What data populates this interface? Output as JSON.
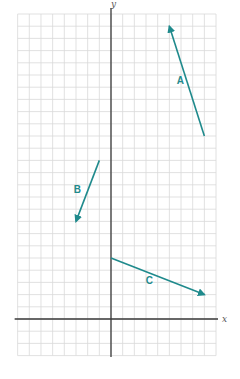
{
  "chart_data": {
    "type": "vector-diagram",
    "title": "",
    "xlabel": "x",
    "ylabel": "y",
    "xlim": [
      -8,
      9
    ],
    "ylim": [
      -3,
      25
    ],
    "grid": true,
    "grid_step": 1,
    "vector_color": "#1f8a8c",
    "vectors": [
      {
        "label": "A",
        "tail": [
          8,
          15
        ],
        "head": [
          5,
          24
        ],
        "displacement": [
          -3,
          9
        ]
      },
      {
        "label": "B",
        "tail": [
          -1,
          13
        ],
        "head": [
          -3,
          8
        ],
        "displacement": [
          -2,
          -5
        ]
      },
      {
        "label": "C",
        "tail": [
          0,
          5
        ],
        "head": [
          8,
          2
        ],
        "displacement": [
          8,
          -3
        ]
      }
    ]
  }
}
